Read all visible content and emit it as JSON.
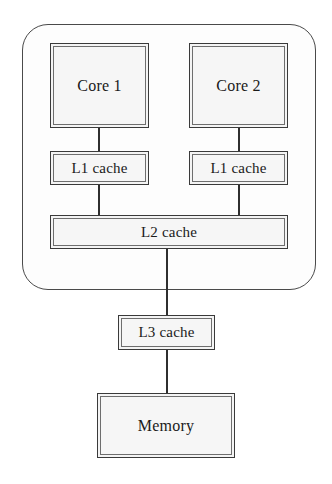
{
  "diagram": {
    "type": "block-diagram",
    "background_color": "#ffffff",
    "node_fill_color": "#f4f4f4",
    "node_border_color": "#3a3a3a",
    "connector_color": "#2f2f2f",
    "package": {
      "name": "cpu-package",
      "shape": "rounded-rectangle",
      "label": ""
    },
    "nodes": [
      {
        "id": "core1",
        "label": "Core 1",
        "level": "core"
      },
      {
        "id": "core2",
        "label": "Core 2",
        "level": "core"
      },
      {
        "id": "l1a",
        "label": "L1 cache",
        "level": "l1"
      },
      {
        "id": "l1b",
        "label": "L1 cache",
        "level": "l1"
      },
      {
        "id": "l2",
        "label": "L2 cache",
        "level": "l2"
      },
      {
        "id": "l3",
        "label": "L3 cache",
        "level": "l3"
      },
      {
        "id": "memory",
        "label": "Memory",
        "level": "memory"
      }
    ],
    "edges": [
      {
        "from": "core1",
        "to": "l1a"
      },
      {
        "from": "core2",
        "to": "l1b"
      },
      {
        "from": "l1a",
        "to": "l2"
      },
      {
        "from": "l1b",
        "to": "l2"
      },
      {
        "from": "l2",
        "to": "l3"
      },
      {
        "from": "l3",
        "to": "memory"
      }
    ]
  }
}
